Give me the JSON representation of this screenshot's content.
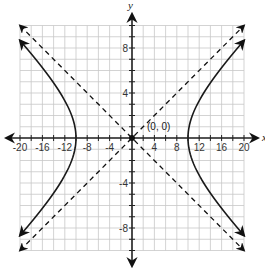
{
  "chart_data": {
    "type": "line",
    "title": "",
    "xlabel": "x",
    "ylabel": "y",
    "xlim": [
      -20,
      20
    ],
    "ylim": [
      -10,
      10
    ],
    "grid": true,
    "grid_x_step": 2,
    "grid_y_step": 1,
    "x_tick_labels": [
      "-20",
      "-16",
      "-12",
      "-8",
      "-4",
      "4",
      "8",
      "12",
      "16",
      "20"
    ],
    "x_tick_values": [
      -20,
      -16,
      -12,
      -8,
      -4,
      4,
      8,
      12,
      16,
      20
    ],
    "y_tick_labels": [
      "8",
      "4",
      "-4",
      "-8"
    ],
    "y_tick_values": [
      8,
      4,
      -4,
      -8
    ],
    "series": [
      {
        "name": "hyperbola",
        "style": "solid",
        "equation": "x^2/100 - y^2/25 = 1",
        "vertices": [
          [
            -10,
            0
          ],
          [
            10,
            0
          ]
        ],
        "branches": [
          "left",
          "right"
        ],
        "x_extent": 20
      },
      {
        "name": "asymptote-1",
        "style": "dashed",
        "equation": "y = x/2",
        "from": [
          -20,
          -10
        ],
        "to": [
          20,
          10
        ]
      },
      {
        "name": "asymptote-2",
        "style": "dashed",
        "equation": "y = -x/2",
        "from": [
          -20,
          10
        ],
        "to": [
          20,
          -10
        ]
      }
    ],
    "points": [
      {
        "x": 0,
        "y": 0,
        "label": "(0, 0)"
      }
    ],
    "legend": null
  },
  "labels": {
    "x_axis": "x",
    "y_axis": "y",
    "center_point": "(0, 0)"
  },
  "colors": {
    "grid": "#c8c8c8",
    "axis": "#222222",
    "curve": "#1a1a1a"
  }
}
